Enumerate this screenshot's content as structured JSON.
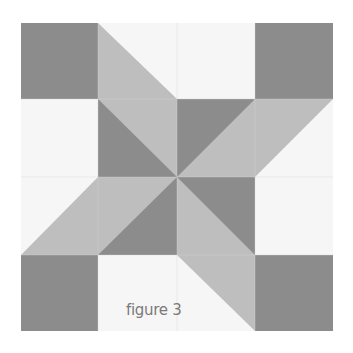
{
  "figure": {
    "caption": "figure 3",
    "colors": {
      "dark": "#8c8c8c",
      "light": "#bebebe",
      "background": "#f6f6f6",
      "seam": "#d8d8d8",
      "caption": "#7a7a7a"
    },
    "grid": {
      "rows": 4,
      "cols": 4,
      "origin": [
        21,
        23
      ],
      "col_edges": [
        21,
        98,
        177,
        255,
        333
      ],
      "row_edges": [
        23,
        99,
        177,
        255,
        331
      ]
    },
    "cells": [
      {
        "row": 0,
        "col": 0,
        "type": "solid",
        "fill": "dark"
      },
      {
        "row": 0,
        "col": 1,
        "type": "hst",
        "fill": "light",
        "corner": "bottom-left"
      },
      {
        "row": 0,
        "col": 2,
        "type": "solid",
        "fill": "background"
      },
      {
        "row": 0,
        "col": 3,
        "type": "solid",
        "fill": "dark"
      },
      {
        "row": 1,
        "col": 0,
        "type": "solid",
        "fill": "background"
      },
      {
        "row": 1,
        "col": 1,
        "type": "hst",
        "fill": "dark",
        "other": "light",
        "corner": "bottom-left"
      },
      {
        "row": 1,
        "col": 2,
        "type": "hst",
        "fill": "dark",
        "other": "light",
        "corner": "top-left"
      },
      {
        "row": 1,
        "col": 3,
        "type": "hst",
        "fill": "light",
        "corner": "top-left"
      },
      {
        "row": 2,
        "col": 0,
        "type": "hst",
        "fill": "light",
        "corner": "bottom-right"
      },
      {
        "row": 2,
        "col": 1,
        "type": "hst",
        "fill": "dark",
        "other": "light",
        "corner": "bottom-right"
      },
      {
        "row": 2,
        "col": 2,
        "type": "hst",
        "fill": "dark",
        "other": "light",
        "corner": "top-right"
      },
      {
        "row": 2,
        "col": 3,
        "type": "solid",
        "fill": "background"
      },
      {
        "row": 3,
        "col": 0,
        "type": "solid",
        "fill": "dark"
      },
      {
        "row": 3,
        "col": 1,
        "type": "solid",
        "fill": "background"
      },
      {
        "row": 3,
        "col": 2,
        "type": "hst",
        "fill": "light",
        "corner": "top-right"
      },
      {
        "row": 3,
        "col": 3,
        "type": "solid",
        "fill": "dark"
      }
    ]
  }
}
